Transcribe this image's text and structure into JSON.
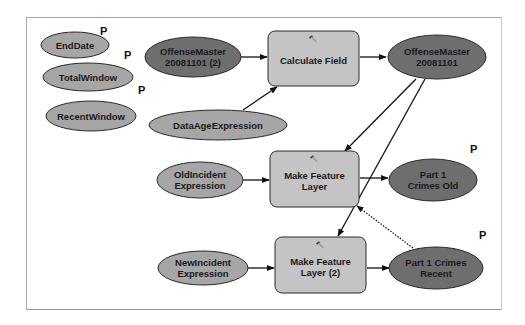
{
  "diagram": {
    "type": "model-builder",
    "colors": {
      "variable_fill": "#a6a6a6",
      "dataset_fill": "#6e6e6e",
      "tool_fill": "#c4c4c4",
      "outline": "#2a2a2a",
      "connector": "#111111"
    },
    "parameter_marker": "P",
    "nodes": {
      "end_date": {
        "lines": [
          "EndDate"
        ],
        "kind": "variable",
        "parameter": true
      },
      "total_window": {
        "lines": [
          "TotalWindow"
        ],
        "kind": "variable",
        "parameter": true
      },
      "recent_window": {
        "lines": [
          "RecentWindow"
        ],
        "kind": "variable",
        "parameter": true
      },
      "offense_master_2": {
        "lines": [
          "OffenseMaster",
          "20081101 (2)"
        ],
        "kind": "dataset",
        "parameter": false
      },
      "data_age_expression": {
        "lines": [
          "DataAgeExpression"
        ],
        "kind": "variable",
        "parameter": false
      },
      "calculate_field": {
        "lines": [
          "Calculate Field"
        ],
        "kind": "tool",
        "parameter": false
      },
      "offense_master": {
        "lines": [
          "OffenseMaster",
          "20081101"
        ],
        "kind": "dataset",
        "parameter": false
      },
      "old_incident_expression": {
        "lines": [
          "OldIncident",
          "Expression"
        ],
        "kind": "variable",
        "parameter": false
      },
      "make_feature_layer": {
        "lines": [
          "Make Feature",
          "Layer"
        ],
        "kind": "tool",
        "parameter": false
      },
      "part1_crimes_old": {
        "lines": [
          "Part 1",
          "Crimes Old"
        ],
        "kind": "dataset",
        "parameter": true
      },
      "new_incident_expression": {
        "lines": [
          "NewIncident",
          "Expression"
        ],
        "kind": "variable",
        "parameter": false
      },
      "make_feature_layer_2": {
        "lines": [
          "Make Feature",
          "Layer (2)"
        ],
        "kind": "tool",
        "parameter": false
      },
      "part1_crimes_recent": {
        "lines": [
          "Part 1 Crimes",
          "Recent"
        ],
        "kind": "dataset",
        "parameter": true
      }
    },
    "edges": [
      {
        "from": "offense_master_2",
        "to": "calculate_field",
        "style": "solid"
      },
      {
        "from": "data_age_expression",
        "to": "calculate_field",
        "style": "solid"
      },
      {
        "from": "calculate_field",
        "to": "offense_master",
        "style": "solid"
      },
      {
        "from": "offense_master",
        "to": "make_feature_layer",
        "style": "solid"
      },
      {
        "from": "offense_master",
        "to": "make_feature_layer_2",
        "style": "solid"
      },
      {
        "from": "old_incident_expression",
        "to": "make_feature_layer",
        "style": "solid"
      },
      {
        "from": "make_feature_layer",
        "to": "part1_crimes_old",
        "style": "solid"
      },
      {
        "from": "new_incident_expression",
        "to": "make_feature_layer_2",
        "style": "solid"
      },
      {
        "from": "make_feature_layer_2",
        "to": "part1_crimes_recent",
        "style": "solid"
      },
      {
        "from": "part1_crimes_recent",
        "to": "make_feature_layer",
        "style": "dotted"
      }
    ]
  }
}
